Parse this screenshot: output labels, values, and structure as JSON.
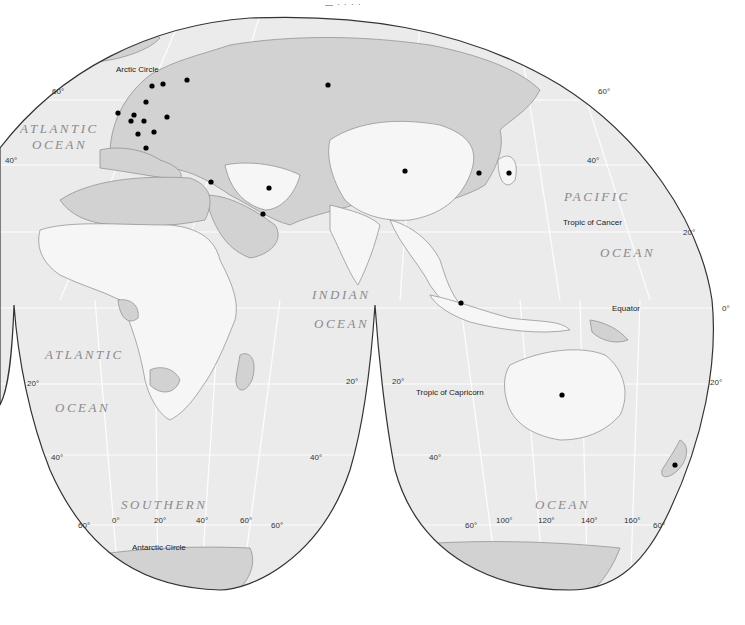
{
  "map": {
    "top_caption": "— · · · · ",
    "ocean_labels": {
      "atlantic_north_1": "ATLANTIC",
      "atlantic_north_2": "OCEAN",
      "atlantic_south_1": "ATLANTIC",
      "atlantic_south_2": "OCEAN",
      "indian_1": "INDIAN",
      "indian_2": "OCEAN",
      "pacific_1": "PACIFIC",
      "pacific_2": "OCEAN",
      "southern_1": "SOUTHERN",
      "southern_2": "OCEAN"
    },
    "line_labels": {
      "arctic_circle": "Arctic Circle",
      "antarctic_circle": "Antarctic Circle",
      "tropic_cancer": "Tropic of Cancer",
      "tropic_capricorn": "Tropic of Capricorn",
      "equator": "Equator"
    },
    "latitude_labels": {
      "l60_left": "60°",
      "l40_left": "40°",
      "l20_left_s": "20°",
      "l40_left_s": "40°",
      "l60_left_s": "60°",
      "l60_right_n": "60°",
      "l40_right_n": "40°",
      "l20_right_n": "20°",
      "l0_right": "0°",
      "l20_right_s": "20°",
      "l20_mid_left": "20°",
      "l20_mid_right": "20°",
      "l40_mid_left": "40°",
      "l40_mid_right": "40°",
      "l60_mid_left": "60°",
      "l60_mid_right": "60°",
      "l60_far_right": "60°"
    },
    "longitude_labels": {
      "lon0": "0°",
      "lon20": "20°",
      "lon40": "40°",
      "lon60": "60°",
      "lon100": "100°",
      "lon120": "120°",
      "lon140": "140°",
      "lon160": "160°"
    },
    "colors": {
      "ocean": "#ececec",
      "land_gray": "#d2d2d2",
      "land_white": "#f6f6f6",
      "border": "#8a8a8a",
      "outline": "#333333",
      "marker": "#000000"
    },
    "markers": [
      {
        "name": "uk",
        "x": 118,
        "y": 113
      },
      {
        "name": "norway",
        "x": 152,
        "y": 86
      },
      {
        "name": "sweden",
        "x": 163,
        "y": 84
      },
      {
        "name": "finland",
        "x": 187,
        "y": 80
      },
      {
        "name": "denmark",
        "x": 146,
        "y": 102
      },
      {
        "name": "netherlands",
        "x": 134,
        "y": 115
      },
      {
        "name": "belgium",
        "x": 131,
        "y": 121
      },
      {
        "name": "germany",
        "x": 144,
        "y": 121
      },
      {
        "name": "poland",
        "x": 167,
        "y": 117
      },
      {
        "name": "france",
        "x": 138,
        "y": 134
      },
      {
        "name": "austria",
        "x": 154,
        "y": 132
      },
      {
        "name": "italy",
        "x": 146,
        "y": 148
      },
      {
        "name": "russia",
        "x": 328,
        "y": 85
      },
      {
        "name": "israel",
        "x": 211,
        "y": 182
      },
      {
        "name": "iran",
        "x": 269,
        "y": 188
      },
      {
        "name": "kuwait",
        "x": 263,
        "y": 214
      },
      {
        "name": "china",
        "x": 405,
        "y": 171
      },
      {
        "name": "korea",
        "x": 479,
        "y": 173
      },
      {
        "name": "japan",
        "x": 509,
        "y": 173
      },
      {
        "name": "singapore",
        "x": 461,
        "y": 303
      },
      {
        "name": "australia",
        "x": 562,
        "y": 395
      },
      {
        "name": "new_zealand",
        "x": 675,
        "y": 465
      }
    ]
  }
}
